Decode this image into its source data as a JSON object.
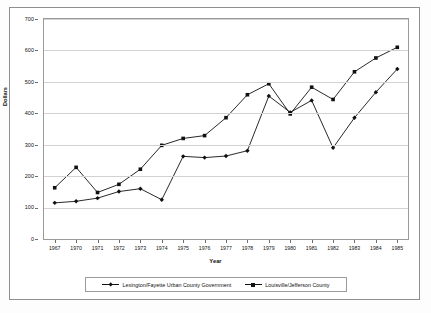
{
  "chart_data": {
    "type": "line",
    "title": "",
    "xlabel": "Year",
    "ylabel": "Dollars",
    "categories": [
      "1967",
      "1970",
      "1971",
      "1972",
      "1973",
      "1974",
      "1975",
      "1976",
      "1977",
      "1978",
      "1979",
      "1980",
      "1981",
      "1982",
      "1983",
      "1984",
      "1985"
    ],
    "ylim": [
      0,
      700
    ],
    "ytick_labels": [
      "0",
      "100",
      "200",
      "300",
      "400",
      "500",
      "600",
      "700"
    ],
    "ytick_values": [
      0,
      100,
      200,
      300,
      400,
      500,
      600,
      700
    ],
    "grid": "horizontal",
    "legend_position": "bottom",
    "series": [
      {
        "name": "Lexington/Fayette Urban County Government",
        "marker": "diamond",
        "values": [
          115,
          120,
          130,
          151,
          160,
          125,
          263,
          259,
          264,
          281,
          455,
          403,
          441,
          290,
          386,
          467,
          541
        ]
      },
      {
        "name": "Louisville/Jefferson County",
        "marker": "square",
        "values": [
          163,
          228,
          148,
          174,
          222,
          298,
          320,
          329,
          386,
          459,
          494,
          398,
          483,
          444,
          532,
          576,
          610
        ]
      }
    ],
    "colors": {
      "line": "#111111",
      "grid": "#d2d2d2",
      "axis": "#9a9a9a",
      "background": "#ffffff"
    }
  },
  "axis": {
    "y_title": "Dollars",
    "x_title": "Year"
  },
  "legend": {
    "entries": [
      {
        "label": "Lexington/Fayette Urban County Government"
      },
      {
        "label": "Louisville/Jefferson County"
      }
    ]
  }
}
